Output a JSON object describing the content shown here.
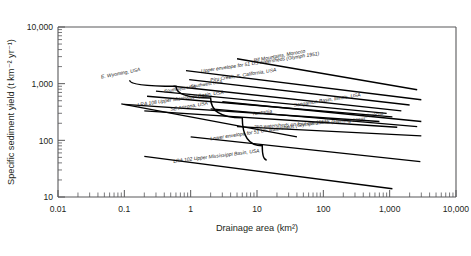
{
  "chart_data": {
    "type": "line",
    "title": "",
    "subtitle": "",
    "xlabel": "Drainage area (km²)",
    "ylabel": "Specific sediment yield (t km⁻² yr⁻¹)",
    "xscale": "log",
    "yscale": "log",
    "xlim": [
      0.01,
      10000
    ],
    "ylim": [
      10,
      10000
    ],
    "grid": false,
    "legend_position": "none",
    "xticks": [
      "0.01",
      "0.1",
      "1",
      "10",
      "100",
      "1,000",
      "10,000"
    ],
    "xtick_values": [
      0.01,
      0.1,
      1,
      10,
      100,
      1000,
      10000
    ],
    "yticks": [
      "10",
      "100",
      "1,000",
      "10,000"
    ],
    "ytick_values": [
      10,
      100,
      1000,
      10000
    ],
    "series": [
      {
        "name": "E. Wyoming, USA",
        "label": "E. Wyoming, USA",
        "kind": "curve",
        "points": [
          [
            0.12,
            1150
          ],
          [
            0.6,
            900
          ],
          [
            2.0,
            560
          ],
          [
            6.0,
            250
          ],
          [
            12.0,
            80
          ],
          [
            14.0,
            45
          ]
        ]
      },
      {
        "name": "SE Arizona, USA",
        "label": "SE Arizona, USA",
        "kind": "straight",
        "points": [
          [
            0.09,
            440
          ],
          [
            40.0,
            115
          ]
        ]
      },
      {
        "name": "Rif Mountains, Morocco",
        "label": "Rif Mountains, Morocco",
        "kind": "straight",
        "points": [
          [
            5.0,
            2750
          ],
          [
            2600,
            780
          ]
        ]
      },
      {
        "name": "Upper envelope for 51 US watersheds (Glymph 1951)",
        "label": "Upper envelope for 51 US watersheds (Glymph 1951)",
        "kind": "straight",
        "points": [
          [
            0.85,
            1700
          ],
          [
            3000,
            520
          ]
        ]
      },
      {
        "name": "Piru Creek, S. California, USA",
        "label": "Piru Creek, S. California, USA",
        "kind": "straight",
        "points": [
          [
            0.95,
            1180
          ],
          [
            2000,
            420
          ]
        ]
      },
      {
        "name": "Southwest USA (upper)",
        "label": "Southwest USA",
        "kind": "straight",
        "points": [
          [
            0.55,
            900
          ],
          [
            1500,
            330
          ]
        ]
      },
      {
        "name": "Southwest USA (lower)",
        "label": "Southwest USA",
        "kind": "straight",
        "points": [
          [
            0.3,
            740
          ],
          [
            900,
            300
          ]
        ]
      },
      {
        "name": "USA",
        "label": "USA",
        "kind": "straight",
        "points": [
          [
            0.22,
            600
          ],
          [
            1100,
            260
          ]
        ]
      },
      {
        "name": "LRA 108 Upper Mississippi Basin, USA",
        "label": "LRA 108 Upper Mississippi Basin, USA",
        "kind": "straight",
        "points": [
          [
            0.1,
            430
          ],
          [
            700,
            215
          ]
        ]
      },
      {
        "name": "Tanzania",
        "label": "Tanzania",
        "kind": "straight",
        "points": [
          [
            0.2,
            330
          ],
          [
            1300,
            170
          ]
        ]
      },
      {
        "name": "Sangamon Basin, Illinois, USA",
        "label": "Sangamon Basin, Illinois, USA",
        "kind": "straight",
        "points": [
          [
            3.0,
            480
          ],
          [
            3000,
            215
          ]
        ]
      },
      {
        "name": "Morocco",
        "label": "Morocco",
        "kind": "straight",
        "points": [
          [
            2.0,
            360
          ],
          [
            2600,
            175
          ]
        ]
      },
      {
        "name": "250 watersheds on four continents (Fleming 1969)",
        "label": "250 watersheds on four continents (Fleming 1969)",
        "kind": "straight",
        "points": [
          [
            5.0,
            175
          ],
          [
            3000,
            120
          ]
        ]
      },
      {
        "name": "Lower envelope for 51 US watersheds (Glymph 1951)",
        "label": "Lower envelope for 51 US watersheds (Glymph 1951)",
        "kind": "straight",
        "points": [
          [
            1.0,
            115
          ],
          [
            2900,
            42
          ]
        ]
      },
      {
        "name": "LRA 102 Upper Mississippi Basin, USA",
        "label": "LRA 102 Upper Mississippi Basin, USA",
        "kind": "straight",
        "points": [
          [
            0.2,
            52
          ],
          [
            1100,
            14
          ]
        ]
      }
    ],
    "annotations": [
      {
        "text": "Rif Mountains, Morocco",
        "x": 9.0,
        "y": 2400,
        "rotate": -10.5,
        "size": "normal"
      },
      {
        "text": "Upper envelope for 51 US watersheds (Glymph 1951)",
        "x": 1.45,
        "y": 1560,
        "rotate": -8.5,
        "size": "normal"
      },
      {
        "text": "Piru Creek, S. California, USA",
        "x": 2.0,
        "y": 1080,
        "rotate": -9.0,
        "size": "normal"
      },
      {
        "text": "Southwest USA",
        "x": 1.0,
        "y": 835,
        "rotate": -9.0,
        "size": "small"
      },
      {
        "text": "Southwest USA",
        "x": 0.4,
        "y": 690,
        "rotate": -9.0,
        "size": "small"
      },
      {
        "text": "USA",
        "x": 1.3,
        "y": 545,
        "rotate": -9.0,
        "size": "small"
      },
      {
        "text": "LRA 108 Upper Mississippi Basin, USA",
        "x": 0.16,
        "y": 395,
        "rotate": -8.5,
        "size": "normal"
      },
      {
        "text": "Tanzania",
        "x": 8.5,
        "y": 275,
        "rotate": -8.0,
        "size": "normal"
      },
      {
        "text": "Sangamon Basin, Illinois, USA",
        "x": 36.0,
        "y": 390,
        "rotate": -9.0,
        "size": "normal"
      },
      {
        "text": "Morocco",
        "x": 420.0,
        "y": 250,
        "rotate": -9.0,
        "size": "normal"
      },
      {
        "text": "250 watersheds on four continents (Fleming 1969)",
        "x": 9.0,
        "y": 160,
        "rotate": -4.0,
        "size": "normal"
      },
      {
        "text": "Lower envelope for 51 US watersheds (Glymph 1951)",
        "x": 2.0,
        "y": 100,
        "rotate": -8.5,
        "size": "normal"
      },
      {
        "text": "E. Wyoming, USA",
        "x": 0.045,
        "y": 1230,
        "rotate": -11.0,
        "size": "normal"
      },
      {
        "text": "SE Arizona, USA",
        "x": 0.5,
        "y": 330,
        "rotate": -9.5,
        "size": "normal"
      },
      {
        "text": "LRA 102 Upper Mississippi Basin, USA",
        "x": 0.55,
        "y": 40,
        "rotate": -7.0,
        "size": "normal"
      }
    ]
  }
}
